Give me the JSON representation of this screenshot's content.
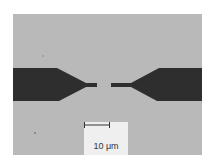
{
  "figure": {
    "kind": "optical micrograph",
    "scale_bar": {
      "label": "10 μm",
      "icon": "scale-bar-icon"
    },
    "colors": {
      "background": "#b9b9b9",
      "electrode": "#2e2e2e",
      "scale_box": "#efefef"
    }
  }
}
